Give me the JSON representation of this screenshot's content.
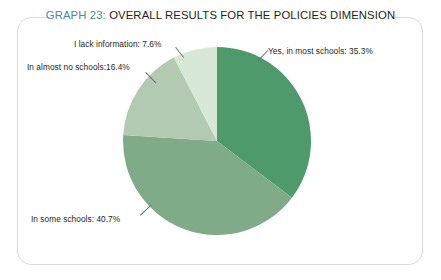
{
  "figure": {
    "title_prefix": "GRAPH 23:",
    "title_text": " OVERALL RESULTS FOR THE POLICIES DIMENSION",
    "title_full": "GRAPH 23: OVERALL RESULTS FOR THE POLICIES DIMENSION",
    "prefix_color": "#4f8b96",
    "title_color": "#231f20",
    "frame_color": "#d9dada",
    "background": "#ffffff"
  },
  "chart_data": {
    "type": "pie",
    "title": "GRAPH 23: OVERALL RESULTS FOR THE POLICIES DIMENSION",
    "xlabel": "",
    "ylabel": "",
    "legend_position": "callout-labels",
    "grid": false,
    "start_angle_deg": 0,
    "direction": "clockwise",
    "units": "percent",
    "categories": [
      "Yes, in most schools",
      "In some schools",
      "In almost no schools",
      "I lack information"
    ],
    "values": [
      35.3,
      40.7,
      16.4,
      7.6
    ],
    "colors": [
      "#4e9a6b",
      "#7fab88",
      "#b2c9b2",
      "#d8e8d6"
    ],
    "slices": [
      {
        "label": "Yes, in most schools",
        "value": 35.3,
        "display": "Yes, in most schools: 35.3%",
        "color": "#4e9a6b",
        "start_deg": 0,
        "end_deg": 127.08
      },
      {
        "label": "In some schools",
        "value": 40.7,
        "display": "In some schools: 40.7%",
        "color": "#7fab88",
        "start_deg": 127.08,
        "end_deg": 273.6
      },
      {
        "label": "In almost no schools",
        "value": 16.4,
        "display": "In almost no schools:16.4%",
        "color": "#b2c9b2",
        "start_deg": 273.6,
        "end_deg": 332.64
      },
      {
        "label": "I lack information",
        "value": 7.6,
        "display": "I lack information: 7.6%",
        "color": "#d8e8d6",
        "start_deg": 332.64,
        "end_deg": 360
      }
    ]
  },
  "labels": {
    "lack_information": "I lack information: 7.6%",
    "almost_no_schools": "In almost no schools:16.4%",
    "most_schools": "Yes, in most schools: 35.3%",
    "some_schools": "In some schools: 40.7%"
  }
}
